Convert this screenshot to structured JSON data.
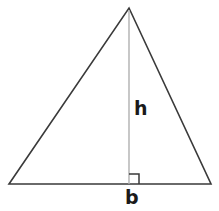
{
  "diagram": {
    "shape": "triangle",
    "background_color": "#ffffff",
    "outline_color": "#3a3a3a",
    "height_line_color": "#b0b0b0",
    "right_angle_color": "#3a3a3a",
    "label_color": "#1a1a1a",
    "labels": {
      "height": "h",
      "base": "b"
    },
    "geometry": {
      "apex": [
        129,
        8
      ],
      "bottom_left": [
        9,
        184
      ],
      "bottom_right": [
        211,
        184
      ],
      "foot_of_height": [
        129,
        184
      ],
      "right_angle_marker_size": 10,
      "outline_stroke_width": 1.6,
      "height_stroke_width": 1.4
    }
  }
}
